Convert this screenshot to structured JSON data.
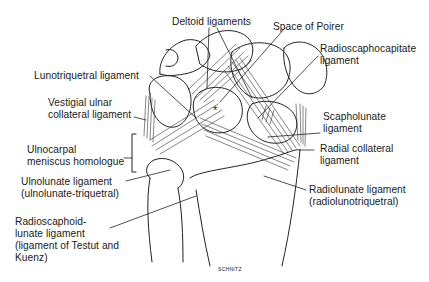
{
  "figure": {
    "signature": "SCHNITZ",
    "asterisk": "*"
  },
  "labels": {
    "deltoid": "Deltoid ligaments",
    "poirer": "Space of Poirer",
    "rsc_line1": "Radioscaphocapitate",
    "rsc_line2": "ligament",
    "lunotriquetral": "Lunotriquetral ligament",
    "vuc_line1": "Vestigial ulnar",
    "vuc_line2": "collateral ligament",
    "scapholunate_line1": "Scapholunate",
    "scapholunate_line2": "ligament",
    "ulnocarpal_line1": "Ulnocarpal",
    "ulnocarpal_line2": "meniscus homologue",
    "radial_coll_line1": "Radial collateral",
    "radial_coll_line2": "ligament",
    "ulnolunate_line1": "Ulnolunate ligament",
    "ulnolunate_line2": "(ulnolunate-triquetral)",
    "radiolunate_line1": "Radiolunate ligament",
    "radiolunate_line2": "(radiolunotriquetral)",
    "rsl_line1": "Radioscaphoid-",
    "rsl_line2": "lunate ligament",
    "rsl_line3": "(ligament of Testut and",
    "rsl_line4": "Kuenz)"
  }
}
